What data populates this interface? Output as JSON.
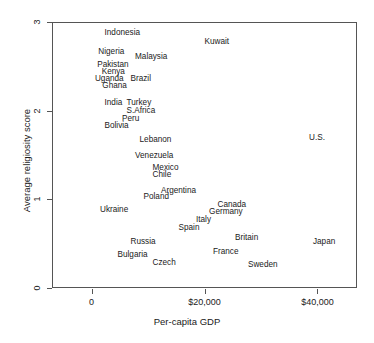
{
  "chart_data": {
    "type": "scatter",
    "title": "",
    "xlabel": "Per-capita GDP",
    "ylabel": "Average religiosity score",
    "xlim": [
      -7000,
      47000
    ],
    "ylim": [
      0,
      3
    ],
    "xticks": [
      0,
      20000,
      40000
    ],
    "xticklabels": [
      "0",
      "$20,000",
      "$40,000"
    ],
    "yticks": [
      0,
      1,
      2,
      3
    ],
    "yticklabels": [
      "0",
      "1",
      "2",
      "3"
    ],
    "grid": false,
    "legend": null,
    "marker": "text-label",
    "points": [
      {
        "label": "Indonesia",
        "x": 2300,
        "y": 2.88
      },
      {
        "label": "Nigeria",
        "x": 1200,
        "y": 2.67
      },
      {
        "label": "Malaysia",
        "x": 7700,
        "y": 2.61
      },
      {
        "label": "Pakistan",
        "x": 1000,
        "y": 2.52
      },
      {
        "label": "Kenya",
        "x": 1800,
        "y": 2.44
      },
      {
        "label": "Uganda",
        "x": 600,
        "y": 2.36
      },
      {
        "label": "Brazil",
        "x": 6900,
        "y": 2.36
      },
      {
        "label": "Ghana",
        "x": 1900,
        "y": 2.28
      },
      {
        "label": "India",
        "x": 2300,
        "y": 2.09
      },
      {
        "label": "Turkey",
        "x": 6200,
        "y": 2.09
      },
      {
        "label": "S.Africa",
        "x": 6200,
        "y": 2.0
      },
      {
        "label": "Peru",
        "x": 5400,
        "y": 1.91
      },
      {
        "label": "Bolivia",
        "x": 2300,
        "y": 1.83
      },
      {
        "label": "Lebanon",
        "x": 8500,
        "y": 1.68
      },
      {
        "label": "Venezuela",
        "x": 7700,
        "y": 1.5
      },
      {
        "label": "Mexico",
        "x": 10800,
        "y": 1.36
      },
      {
        "label": "Chile",
        "x": 10800,
        "y": 1.28
      },
      {
        "label": "Argentina",
        "x": 12300,
        "y": 1.1
      },
      {
        "label": "Poland",
        "x": 9200,
        "y": 1.03
      },
      {
        "label": "Ukraine",
        "x": 1500,
        "y": 0.88
      },
      {
        "label": "Canada",
        "x": 22300,
        "y": 0.94
      },
      {
        "label": "Germany",
        "x": 20800,
        "y": 0.86
      },
      {
        "label": "Italy",
        "x": 18500,
        "y": 0.77
      },
      {
        "label": "Spain",
        "x": 15400,
        "y": 0.68
      },
      {
        "label": "Britain",
        "x": 25400,
        "y": 0.57
      },
      {
        "label": "France",
        "x": 21500,
        "y": 0.41
      },
      {
        "label": "Sweden",
        "x": 27700,
        "y": 0.26
      },
      {
        "label": "Russia",
        "x": 6900,
        "y": 0.53
      },
      {
        "label": "Bulgaria",
        "x": 4600,
        "y": 0.38
      },
      {
        "label": "Czech",
        "x": 10800,
        "y": 0.29
      },
      {
        "label": "Kuwait",
        "x": 20000,
        "y": 2.78
      },
      {
        "label": "U.S.",
        "x": 38500,
        "y": 1.7
      },
      {
        "label": "Japan",
        "x": 39200,
        "y": 0.52
      }
    ]
  }
}
